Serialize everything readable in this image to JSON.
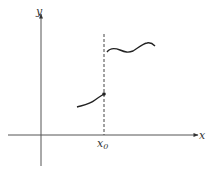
{
  "diagram": {
    "type": "function-jump-discontinuity",
    "axes": {
      "x_label": "x",
      "y_label": "y"
    },
    "marker": {
      "label": "x",
      "subscript": "0"
    },
    "elements": [
      {
        "name": "left-curve",
        "description": "curve approaching x0 from the left, ending in a filled dot"
      },
      {
        "name": "right-curve",
        "description": "wavy curve starting just right of x0 at a higher value"
      },
      {
        "name": "dashed-vertical-line",
        "description": "vertical dashed line at x = x0"
      }
    ],
    "colors": {
      "stroke": "#333333",
      "background": "#ffffff"
    }
  }
}
